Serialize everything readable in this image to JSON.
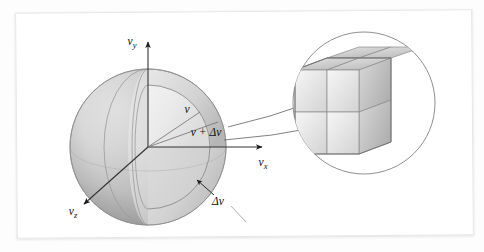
{
  "figure": {
    "kind": "physics-diagram",
    "background_color": "#fdfdfd",
    "card_color": "#ffffff",
    "card_border_color": "#e7e7e7"
  },
  "axes": {
    "y_label": "v",
    "y_subscript": "y",
    "x_label": "v",
    "x_subscript": "x",
    "z_label": "v",
    "z_subscript": "z",
    "axis_color": "#333333"
  },
  "sphere": {
    "name": "velocity-space-sphere",
    "center_x": 148,
    "center_y": 147,
    "radius": 78,
    "fill_light": "#ffffff",
    "fill_mid": "#d8d8d8",
    "fill_dark": "#a9a9a9",
    "outline_color": "#9a9a9a"
  },
  "shell": {
    "name": "velocity-shell",
    "inner_radius_label": "v",
    "outer_radius_label": "v + Δv",
    "thickness_label": "Δv",
    "inner_radius": 62,
    "outer_radius": 78
  },
  "labels": {
    "speed": "v",
    "speed_plus_delta": "v + Δv",
    "delta_v": "Δv"
  },
  "inset": {
    "name": "magnified-volume-element",
    "circle_center_x": 364,
    "circle_center_y": 103,
    "circle_radius": 71,
    "circle_stroke": "#8f8f8f",
    "cube_description": "2 by 2 by 2 block of velocity-space volume elements",
    "cube_divisions": 2,
    "face_top_color": "#d2d2d2",
    "face_front_color": "#eaeaea",
    "face_side_color": "#c3c3c3",
    "edge_color": "#8a8a8a"
  },
  "connectors": {
    "name": "callout-lines",
    "color": "#6a6a6a",
    "count": 2
  }
}
